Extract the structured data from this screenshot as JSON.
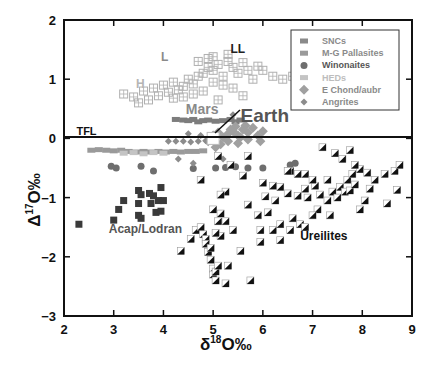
{
  "chart_data": {
    "type": "scatter",
    "title": "",
    "xlabel": "δ18O‰",
    "ylabel": "Δ17O‰",
    "xlim": [
      2,
      9
    ],
    "ylim": [
      -3,
      2
    ],
    "x_ticks": [
      "2",
      "3",
      "4",
      "5",
      "6",
      "7",
      "8",
      "9"
    ],
    "y_ticks": [
      "2",
      "1",
      "0",
      "−1",
      "−2",
      "−3"
    ],
    "grid": false,
    "legend_position": "upper-right",
    "reference_line": {
      "label": "TFL",
      "y": 0
    },
    "legend": [
      {
        "name": "SNCs",
        "marker": "square-small",
        "color": "#8a8a8a"
      },
      {
        "name": "M-G Pallasites",
        "marker": "square-small",
        "color": "#9a9a9a"
      },
      {
        "name": "Winonaites",
        "marker": "circle",
        "color": "#6e6e6e"
      },
      {
        "name": "HEDs",
        "marker": "square-small",
        "color": "#c4c4c4"
      },
      {
        "name": "E Chond/aubr",
        "marker": "diamond",
        "color": "#a0a0a0"
      },
      {
        "name": "Angrites",
        "marker": "diamond-small",
        "color": "#8c8c8c"
      }
    ],
    "annotations": [
      {
        "text": "L",
        "x": 3.95,
        "y": 1.3
      },
      {
        "text": "LL",
        "x": 5.35,
        "y": 1.45
      },
      {
        "text": "H",
        "x": 3.45,
        "y": 0.85
      },
      {
        "text": "Mars",
        "x": 4.45,
        "y": 0.42
      },
      {
        "text": "Earth",
        "x": 5.55,
        "y": 0.28
      },
      {
        "text": "TFL",
        "x": 2.25,
        "y": 0.06
      },
      {
        "text": "Acap/Lodran",
        "x": 2.9,
        "y": -1.6
      },
      {
        "text": "Ureilites",
        "x": 6.75,
        "y": -1.72
      }
    ],
    "series": [
      {
        "name": "Ordinary chondrites (H, L, LL)",
        "marker": "grid-square",
        "color": "#b0b0b0",
        "points": [
          [
            3.2,
            0.75
          ],
          [
            3.4,
            0.7
          ],
          [
            3.6,
            0.8
          ],
          [
            3.7,
            0.65
          ],
          [
            3.8,
            0.85
          ],
          [
            3.9,
            0.72
          ],
          [
            4.0,
            0.9
          ],
          [
            4.1,
            0.78
          ],
          [
            4.2,
            0.95
          ],
          [
            4.3,
            0.82
          ],
          [
            4.4,
            0.88
          ],
          [
            4.5,
            1.0
          ],
          [
            4.6,
            0.92
          ],
          [
            4.7,
            1.05
          ],
          [
            4.8,
            1.1
          ],
          [
            4.6,
            0.75
          ],
          [
            4.4,
            0.7
          ],
          [
            4.2,
            0.68
          ],
          [
            3.5,
            0.6
          ],
          [
            4.9,
            1.2
          ],
          [
            5.0,
            1.15
          ],
          [
            5.1,
            1.25
          ],
          [
            5.2,
            1.05
          ],
          [
            5.3,
            1.3
          ],
          [
            5.4,
            1.2
          ],
          [
            5.5,
            1.1
          ],
          [
            5.6,
            1.28
          ],
          [
            5.7,
            1.15
          ],
          [
            5.8,
            1.0
          ],
          [
            5.9,
            1.22
          ],
          [
            6.0,
            1.15
          ],
          [
            6.2,
            1.05
          ],
          [
            6.4,
            1.0
          ],
          [
            6.6,
            1.05
          ],
          [
            6.7,
            1.0
          ],
          [
            5.0,
            0.95
          ],
          [
            5.2,
            0.9
          ],
          [
            5.4,
            0.85
          ],
          [
            5.6,
            0.72
          ],
          [
            4.8,
            0.8
          ],
          [
            5.1,
            0.65
          ],
          [
            4.9,
            1.35
          ],
          [
            5.0,
            1.38
          ],
          [
            5.3,
            1.42
          ],
          [
            4.7,
            1.3
          ]
        ]
      },
      {
        "name": "SNCs",
        "marker": "square-small",
        "color": "#7d7d7d",
        "points": [
          [
            4.25,
            0.32
          ],
          [
            4.4,
            0.31
          ],
          [
            4.5,
            0.3
          ],
          [
            4.6,
            0.32
          ],
          [
            4.7,
            0.28
          ],
          [
            4.8,
            0.3
          ],
          [
            4.9,
            0.31
          ],
          [
            5.05,
            0.29
          ],
          [
            5.2,
            0.3
          ],
          [
            5.35,
            0.32
          ],
          [
            5.45,
            0.28
          ],
          [
            5.55,
            0.31
          ]
        ]
      },
      {
        "name": "M-G Pallasites",
        "marker": "square-small",
        "color": "#9a9a9a",
        "points": [
          [
            2.55,
            -0.2
          ],
          [
            2.7,
            -0.19
          ],
          [
            2.85,
            -0.2
          ],
          [
            3.0,
            -0.21
          ],
          [
            3.15,
            -0.2
          ],
          [
            3.3,
            -0.22
          ],
          [
            3.45,
            -0.23
          ],
          [
            3.6,
            -0.22
          ],
          [
            3.75,
            -0.23
          ],
          [
            3.9,
            -0.22
          ],
          [
            4.05,
            -0.23
          ],
          [
            4.2,
            -0.22
          ],
          [
            4.35,
            -0.23
          ],
          [
            4.5,
            -0.22
          ],
          [
            4.65,
            -0.22
          ],
          [
            4.8,
            -0.21
          ]
        ]
      },
      {
        "name": "Winonaites",
        "marker": "circle",
        "color": "#6e6e6e",
        "points": [
          [
            2.95,
            -0.47
          ],
          [
            3.05,
            -0.5
          ],
          [
            3.55,
            -0.47
          ],
          [
            3.8,
            -0.55
          ],
          [
            4.6,
            -0.51
          ],
          [
            5.05,
            -0.5
          ],
          [
            5.25,
            -0.49
          ],
          [
            5.45,
            -0.48
          ],
          [
            5.7,
            -0.5
          ],
          [
            6.0,
            -0.5
          ],
          [
            6.55,
            -0.45
          ],
          [
            6.65,
            -0.42
          ]
        ]
      },
      {
        "name": "HEDs",
        "marker": "square-small",
        "color": "#c4c4c4",
        "points": [
          [
            3.2,
            -0.25
          ],
          [
            3.4,
            -0.24
          ],
          [
            3.6,
            -0.26
          ],
          [
            3.8,
            -0.24
          ],
          [
            4.0,
            -0.25
          ]
        ]
      },
      {
        "name": "E Chond/aubr",
        "marker": "diamond",
        "color": "#a0a0a0",
        "points": [
          [
            5.0,
            0.05
          ],
          [
            5.1,
            0.1
          ],
          [
            5.2,
            0.02
          ],
          [
            5.3,
            0.08
          ],
          [
            5.4,
            0.12
          ],
          [
            5.5,
            0.05
          ],
          [
            5.6,
            0.15
          ],
          [
            5.7,
            0.1
          ],
          [
            5.8,
            0.18
          ],
          [
            5.9,
            0.05
          ],
          [
            6.0,
            0.12
          ],
          [
            5.3,
            -0.05
          ],
          [
            5.5,
            -0.08
          ],
          [
            5.7,
            -0.02
          ],
          [
            5.15,
            -0.1
          ],
          [
            5.45,
            0.2
          ],
          [
            5.65,
            0.22
          ],
          [
            5.95,
            -0.05
          ],
          [
            4.9,
            -0.05
          ],
          [
            5.05,
            -0.15
          ],
          [
            5.55,
            0.02
          ],
          [
            5.35,
            0.15
          ]
        ]
      },
      {
        "name": "Angrites",
        "marker": "diamond-small",
        "color": "#8c8c8c",
        "points": [
          [
            4.1,
            -0.05
          ],
          [
            4.25,
            -0.05
          ],
          [
            4.4,
            -0.05
          ],
          [
            4.55,
            -0.06
          ],
          [
            4.7,
            -0.05
          ],
          [
            4.85,
            -0.04
          ],
          [
            4.5,
            0.08
          ],
          [
            4.75,
            0.05
          ],
          [
            5.4,
            0.4
          ],
          [
            4.6,
            -0.42
          ],
          [
            5.2,
            -0.35
          ],
          [
            4.3,
            -0.35
          ]
        ]
      },
      {
        "name": "Acap/Lodran",
        "marker": "square",
        "color": "#3a3a3a",
        "points": [
          [
            2.3,
            -1.45
          ],
          [
            3.0,
            -1.38
          ],
          [
            3.1,
            -1.2
          ],
          [
            3.2,
            -1.05
          ],
          [
            3.5,
            -0.88
          ],
          [
            3.55,
            -0.95
          ],
          [
            3.5,
            -1.1
          ],
          [
            3.5,
            -1.3
          ],
          [
            3.55,
            -1.35
          ],
          [
            3.75,
            -1.1
          ],
          [
            3.72,
            -0.93
          ],
          [
            3.8,
            -0.97
          ],
          [
            3.95,
            -0.83
          ],
          [
            3.9,
            -1.05
          ],
          [
            4.0,
            -1.05
          ],
          [
            3.85,
            -1.25
          ],
          [
            3.95,
            -1.23
          ]
        ]
      },
      {
        "name": "Ureilites",
        "marker": "half-square",
        "color": "#111111",
        "points": [
          [
            4.35,
            -1.9
          ],
          [
            4.55,
            -1.7
          ],
          [
            4.65,
            -1.55
          ],
          [
            4.75,
            -1.5
          ],
          [
            4.8,
            -1.62
          ],
          [
            4.85,
            -1.7
          ],
          [
            4.85,
            -1.78
          ],
          [
            4.9,
            -1.92
          ],
          [
            4.95,
            -1.85
          ],
          [
            4.95,
            -2.05
          ],
          [
            5.0,
            -2.2
          ],
          [
            5.0,
            -2.3
          ],
          [
            5.05,
            -2.25
          ],
          [
            5.1,
            -2.15
          ],
          [
            5.05,
            -2.4
          ],
          [
            5.25,
            -2.45
          ],
          [
            5.3,
            -2.15
          ],
          [
            5.15,
            -1.65
          ],
          [
            5.25,
            -1.4
          ],
          [
            5.4,
            -1.55
          ],
          [
            5.55,
            -1.9
          ],
          [
            5.75,
            -2.4
          ],
          [
            5.0,
            -1.2
          ],
          [
            5.15,
            -1.27
          ],
          [
            5.1,
            -1.4
          ],
          [
            5.25,
            -0.9
          ],
          [
            5.15,
            -0.95
          ],
          [
            4.75,
            -0.7
          ],
          [
            5.1,
            -0.3
          ],
          [
            5.35,
            -0.45
          ],
          [
            5.7,
            -0.3
          ],
          [
            5.6,
            -0.63
          ],
          [
            5.7,
            -1.12
          ],
          [
            5.9,
            -1.3
          ],
          [
            5.95,
            -1.55
          ],
          [
            6.1,
            -1.25
          ],
          [
            6.25,
            -1.05
          ],
          [
            6.05,
            -0.98
          ],
          [
            6.35,
            -0.82
          ],
          [
            6.5,
            -0.93
          ],
          [
            6.7,
            -0.97
          ],
          [
            6.9,
            -1.0
          ],
          [
            6.85,
            -0.85
          ],
          [
            7.05,
            -0.8
          ],
          [
            7.15,
            -0.95
          ],
          [
            7.3,
            -1.05
          ],
          [
            7.4,
            -0.9
          ],
          [
            7.55,
            -0.82
          ],
          [
            7.65,
            -0.9
          ],
          [
            7.75,
            -0.88
          ],
          [
            7.5,
            -1.0
          ],
          [
            7.7,
            -0.7
          ],
          [
            7.8,
            -0.6
          ],
          [
            7.95,
            -0.52
          ],
          [
            8.1,
            -0.58
          ],
          [
            7.85,
            -0.45
          ],
          [
            7.6,
            -0.35
          ],
          [
            7.45,
            -0.25
          ],
          [
            7.2,
            -0.15
          ],
          [
            8.25,
            -0.7
          ],
          [
            8.45,
            -0.6
          ],
          [
            8.65,
            -0.55
          ],
          [
            8.75,
            -0.45
          ],
          [
            8.05,
            -1.05
          ],
          [
            8.7,
            -0.87
          ],
          [
            7.95,
            -1.2
          ],
          [
            8.5,
            -1.1
          ],
          [
            6.55,
            -0.55
          ],
          [
            6.7,
            -0.6
          ],
          [
            6.85,
            -0.6
          ],
          [
            7.0,
            -0.7
          ],
          [
            7.1,
            -1.2
          ],
          [
            7.0,
            -1.3
          ],
          [
            6.6,
            -1.35
          ],
          [
            6.35,
            -1.45
          ],
          [
            6.55,
            -1.55
          ],
          [
            6.2,
            -1.55
          ],
          [
            5.95,
            -1.75
          ],
          [
            6.35,
            -1.72
          ],
          [
            6.5,
            -0.55
          ],
          [
            7.3,
            -0.7
          ],
          [
            7.75,
            -0.2
          ],
          [
            6.0,
            -0.75
          ],
          [
            6.2,
            -0.8
          ],
          [
            6.75,
            -1.45
          ],
          [
            6.85,
            -1.5
          ],
          [
            7.35,
            -1.3
          ],
          [
            7.85,
            -0.78
          ],
          [
            8.15,
            -0.85
          ],
          [
            5.05,
            -1.6
          ]
        ]
      },
      {
        "name": "Earth",
        "marker": "open-square",
        "color": "#ffffff",
        "points": [
          [
            5.0,
            0.0
          ]
        ]
      }
    ]
  }
}
